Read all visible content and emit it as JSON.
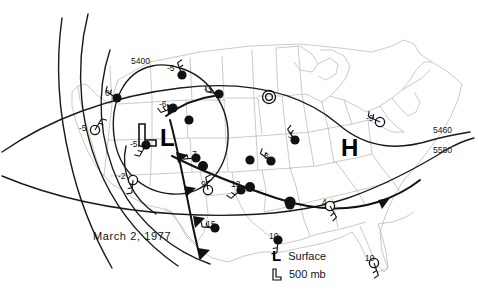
{
  "figure": {
    "title_label": "March 2, 1977",
    "type": "weather-map",
    "region": "contiguous United States"
  },
  "pressure_centers": [
    {
      "name": "surface-low",
      "symbol": "L",
      "style": "solid",
      "x": 167,
      "y": 139
    },
    {
      "name": "surface-high",
      "symbol": "H",
      "style": "solid",
      "x": 348,
      "y": 148
    },
    {
      "name": "upper-low-500mb",
      "symbol": "L",
      "style": "outline",
      "x": 142,
      "y": 132
    }
  ],
  "contour_labels": [
    {
      "value": "5400",
      "x": 134,
      "y": 62
    },
    {
      "value": "5460",
      "x": 436,
      "y": 131
    },
    {
      "value": "5580",
      "x": 436,
      "y": 151
    }
  ],
  "stations": [
    {
      "value": "0",
      "fill": "solid",
      "x": 117,
      "y": 98,
      "lx": 105,
      "ly": 89
    },
    {
      "value": "-5",
      "fill": "solid",
      "x": 182,
      "y": 75,
      "lx": 167,
      "ly": 64
    },
    {
      "value": "-3",
      "fill": "solid",
      "x": 219,
      "y": 94,
      "lx": 204,
      "ly": 85
    },
    {
      "value": "-6",
      "fill": "solid",
      "x": 173,
      "y": 108,
      "lx": 159,
      "ly": 100
    },
    {
      "value": "-5",
      "fill": "hollow",
      "x": 95,
      "y": 130,
      "lx": 79,
      "ly": 124
    },
    {
      "value": "-5",
      "fill": "solid",
      "x": 146,
      "y": 145,
      "lx": 130,
      "ly": 140
    },
    {
      "value": "-2",
      "fill": "hollow",
      "x": 133,
      "y": 180,
      "lx": 118,
      "ly": 172
    },
    {
      "value": "-9",
      "fill": "hollow",
      "x": 380,
      "y": 122,
      "lx": 366,
      "ly": 114
    },
    {
      "value": "3",
      "fill": "solid",
      "x": 295,
      "y": 140,
      "lx": 288,
      "ly": 131
    },
    {
      "value": "3",
      "fill": "solid",
      "x": 271,
      "y": 161,
      "lx": 264,
      "ly": 152
    },
    {
      "value": "7",
      "fill": "solid",
      "x": 196,
      "y": 158,
      "lx": 192,
      "ly": 150
    },
    {
      "value": "9",
      "fill": "hollow",
      "x": 208,
      "y": 190,
      "lx": 201,
      "ly": 180
    },
    {
      "value": "12",
      "fill": "solid",
      "x": 241,
      "y": 190,
      "lx": 231,
      "ly": 180
    },
    {
      "value": "15",
      "fill": "solid",
      "x": 215,
      "y": 228,
      "lx": 206,
      "ly": 220
    },
    {
      "value": "10",
      "fill": "solid",
      "x": 278,
      "y": 240,
      "lx": 269,
      "ly": 232
    },
    {
      "value": "4",
      "fill": "hollow",
      "x": 330,
      "y": 206,
      "lx": 322,
      "ly": 198
    },
    {
      "value": "10",
      "fill": "hollow",
      "x": 374,
      "y": 263,
      "lx": 365,
      "ly": 254
    },
    {
      "value": "",
      "fill": "solid",
      "x": 189,
      "y": 120,
      "lx": 0,
      "ly": 0
    },
    {
      "value": "",
      "fill": "solid",
      "x": 250,
      "y": 160,
      "lx": 0,
      "ly": 0
    },
    {
      "value": "",
      "fill": "solid",
      "x": 290,
      "y": 205,
      "lx": 0,
      "ly": 0
    }
  ],
  "legend": {
    "surface_symbol": "L",
    "surface_label": "Surface",
    "upper_symbol": "L",
    "upper_label": "500 mb"
  },
  "colors": {
    "ink": "#141414",
    "state_border": "#b9b9b9",
    "contour": "#1a1a1a",
    "background": "#ffffff"
  }
}
